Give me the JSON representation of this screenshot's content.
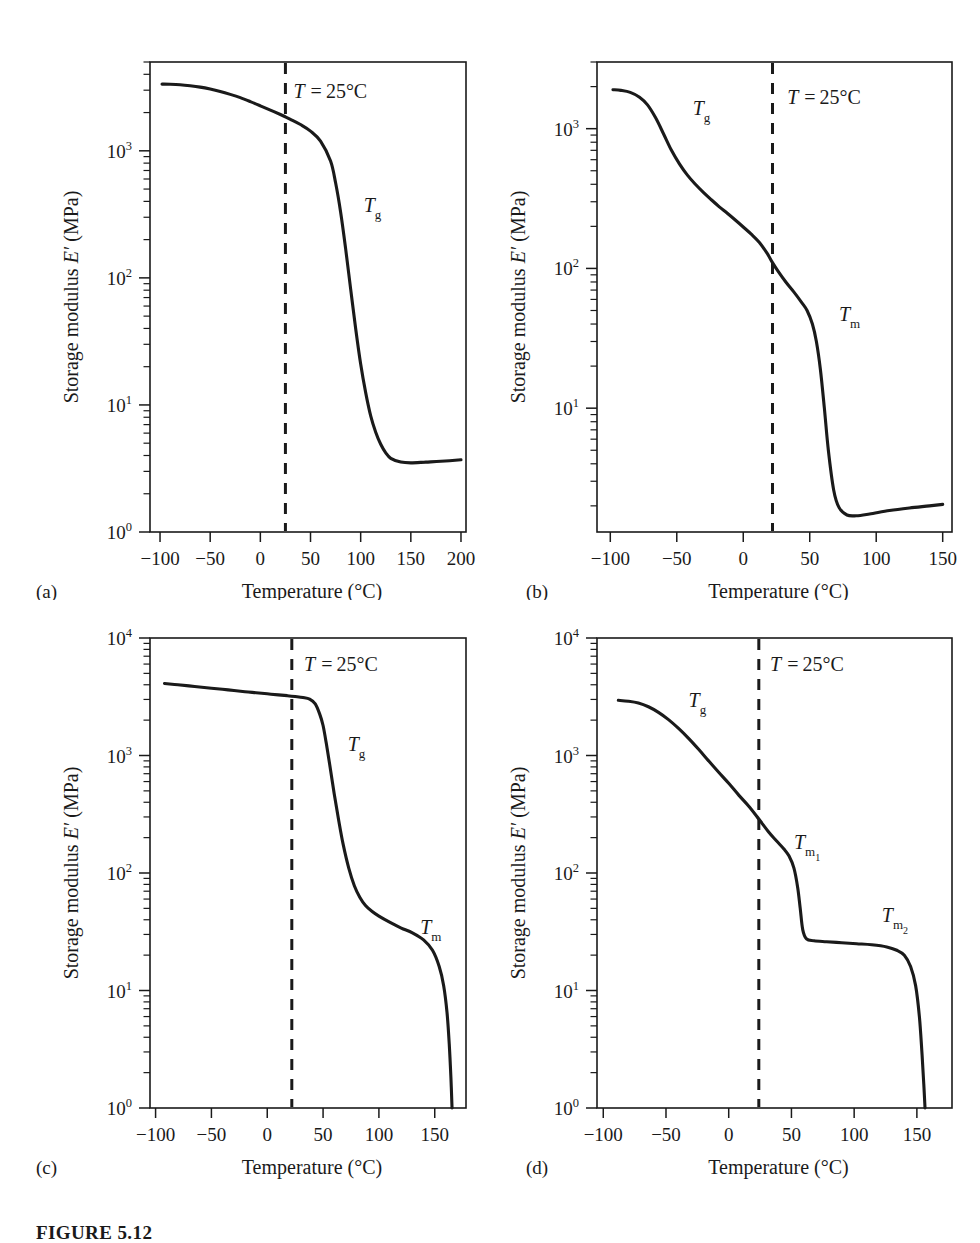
{
  "figure": {
    "caption_label": "FIGURE 5.12",
    "axis_x_title": "Temperature (°C)",
    "axis_y_title_prefix": "Storage modulus ",
    "axis_y_title_symbol": "E′",
    "axis_y_title_units": " (MPa)",
    "marker_label": "T = 25°C",
    "marker_temperature": 25
  },
  "chart_data": [
    {
      "type": "line",
      "panel": "a",
      "panel_letter": "(a)",
      "title": "",
      "xlabel": "Temperature (°C)",
      "ylabel": "Storage modulus E′ (MPa)",
      "xlim": [
        -110,
        205
      ],
      "ylim": [
        1,
        5000
      ],
      "yscale": "log",
      "xticks": [
        -100,
        -50,
        0,
        50,
        100,
        150,
        200
      ],
      "xtick_labels": [
        "−100",
        "−50",
        "0",
        "50",
        "100",
        "150",
        "200"
      ],
      "yticks": [
        1,
        10,
        100,
        1000
      ],
      "ytick_labels": [
        "10⁰",
        "10¹",
        "10²",
        "10³"
      ],
      "grid": false,
      "annotations": [
        {
          "text": "T = 25°C",
          "x": 33,
          "y": 2600,
          "kind": "marker-label"
        },
        {
          "text": "Tg",
          "base": "T",
          "sub": "g",
          "x": 103,
          "y": 330,
          "kind": "transition"
        }
      ],
      "vline": {
        "x": 25,
        "style": "dashed",
        "label": "T = 25°C"
      },
      "series": [
        {
          "name": "storage modulus",
          "x": [
            -98,
            -90,
            -80,
            -70,
            -60,
            -50,
            -40,
            -30,
            -20,
            -10,
            0,
            10,
            20,
            25,
            30,
            40,
            50,
            60,
            70,
            75,
            80,
            85,
            90,
            95,
            100,
            105,
            110,
            115,
            120,
            125,
            130,
            140,
            150,
            165,
            180,
            200
          ],
          "y": [
            3350,
            3340,
            3310,
            3250,
            3170,
            3060,
            2930,
            2780,
            2620,
            2440,
            2260,
            2090,
            1930,
            1850,
            1770,
            1610,
            1430,
            1190,
            830,
            560,
            330,
            170,
            82,
            40,
            21,
            12.5,
            8.2,
            6.1,
            4.9,
            4.2,
            3.8,
            3.55,
            3.5,
            3.55,
            3.6,
            3.7
          ]
        }
      ]
    },
    {
      "type": "line",
      "panel": "b",
      "panel_letter": "(b)",
      "title": "",
      "xlabel": "Temperature (°C)",
      "ylabel": "Storage modulus E′ (MPa)",
      "xlim": [
        -110,
        157
      ],
      "ylim": [
        1.3,
        3000
      ],
      "yscale": "log",
      "xticks": [
        -100,
        -50,
        0,
        50,
        100,
        150
      ],
      "xtick_labels": [
        "−100",
        "−50",
        "0",
        "50",
        "100",
        "150"
      ],
      "yticks": [
        10,
        100,
        1000
      ],
      "ytick_labels": [
        "10¹",
        "10²",
        "10³"
      ],
      "grid": false,
      "annotations": [
        {
          "text": "T = 25°C",
          "x": 33,
          "y": 1500,
          "kind": "marker-label"
        },
        {
          "text": "Tg",
          "base": "T",
          "sub": "g",
          "x": -38,
          "y": 1250,
          "kind": "transition"
        },
        {
          "text": "Tm",
          "base": "T",
          "sub": "m",
          "x": 72,
          "y": 42,
          "kind": "transition"
        }
      ],
      "vline": {
        "x": 22,
        "style": "dashed",
        "label": "T = 25°C"
      },
      "series": [
        {
          "name": "storage modulus",
          "x": [
            -98,
            -92,
            -85,
            -78,
            -72,
            -66,
            -60,
            -54,
            -48,
            -42,
            -36,
            -30,
            -24,
            -18,
            -12,
            -6,
            0,
            6,
            12,
            18,
            22,
            26,
            32,
            38,
            44,
            48,
            52,
            55,
            58,
            61,
            64,
            68,
            72,
            78,
            85,
            95,
            110,
            125,
            140,
            150
          ],
          "y": [
            1900,
            1880,
            1820,
            1680,
            1480,
            1200,
            920,
            700,
            560,
            465,
            400,
            350,
            310,
            276,
            248,
            222,
            198,
            176,
            154,
            128,
            110,
            96,
            80,
            68,
            57,
            50,
            40,
            30,
            19,
            10,
            5.0,
            2.6,
            1.95,
            1.72,
            1.7,
            1.75,
            1.85,
            1.93,
            2.0,
            2.05
          ]
        }
      ]
    },
    {
      "type": "line",
      "panel": "c",
      "panel_letter": "(c)",
      "title": "",
      "xlabel": "Temperature (°C)",
      "ylabel": "Storage modulus E′ (MPa)",
      "xlim": [
        -105,
        178
      ],
      "ylim": [
        1,
        10000
      ],
      "yscale": "log",
      "xticks": [
        -100,
        -50,
        0,
        50,
        100,
        150
      ],
      "xtick_labels": [
        "−100",
        "−50",
        "0",
        "50",
        "100",
        "150"
      ],
      "yticks": [
        1,
        10,
        100,
        1000,
        10000
      ],
      "ytick_labels": [
        "10⁰",
        "10¹",
        "10²",
        "10³",
        "10⁴"
      ],
      "grid": false,
      "annotations": [
        {
          "text": "T = 25°C",
          "x": 33,
          "y": 5200,
          "kind": "marker-label"
        },
        {
          "text": "Tg",
          "base": "T",
          "sub": "g",
          "x": 72,
          "y": 1100,
          "kind": "transition"
        },
        {
          "text": "Tm",
          "base": "T",
          "sub": "m",
          "x": 137,
          "y": 30,
          "kind": "transition"
        }
      ],
      "vline": {
        "x": 22,
        "style": "dashed",
        "label": "T = 25°C"
      },
      "series": [
        {
          "name": "storage modulus",
          "x": [
            -92,
            -80,
            -65,
            -50,
            -35,
            -20,
            -10,
            0,
            10,
            18,
            25,
            32,
            38,
            43,
            47,
            50,
            53,
            56,
            60,
            64,
            68,
            73,
            78,
            83,
            88,
            94,
            100,
            110,
            120,
            130,
            140,
            148,
            154,
            158,
            161,
            163,
            164.5,
            165.5
          ],
          "y": [
            4100,
            4000,
            3870,
            3740,
            3620,
            3490,
            3420,
            3350,
            3280,
            3230,
            3180,
            3120,
            3020,
            2750,
            2250,
            1800,
            1250,
            830,
            470,
            280,
            175,
            110,
            78,
            62,
            53,
            47,
            43,
            38,
            34,
            31,
            27,
            22,
            16,
            11,
            6.5,
            3.5,
            1.8,
            1.0
          ]
        }
      ]
    },
    {
      "type": "line",
      "panel": "d",
      "panel_letter": "(d)",
      "title": "",
      "xlabel": "Temperature (°C)",
      "ylabel": "Storage modulus E′ (MPa)",
      "xlim": [
        -105,
        178
      ],
      "ylim": [
        1,
        10000
      ],
      "yscale": "log",
      "xticks": [
        -100,
        -50,
        0,
        50,
        100,
        150
      ],
      "xtick_labels": [
        "−100",
        "−50",
        "0",
        "50",
        "100",
        "150"
      ],
      "yticks": [
        1,
        10,
        100,
        1000,
        10000
      ],
      "ytick_labels": [
        "10⁰",
        "10¹",
        "10²",
        "10³",
        "10⁴"
      ],
      "grid": false,
      "annotations": [
        {
          "text": "T = 25°C",
          "x": 33,
          "y": 5200,
          "kind": "marker-label"
        },
        {
          "text": "Tg",
          "base": "T",
          "sub": "g",
          "x": -32,
          "y": 2600,
          "kind": "transition"
        },
        {
          "text": "Tm1",
          "base": "T",
          "sub": "m",
          "sub2": "1",
          "x": 52,
          "y": 160,
          "kind": "transition"
        },
        {
          "text": "Tm2",
          "base": "T",
          "sub": "m",
          "sub2": "2",
          "x": 122,
          "y": 38,
          "kind": "transition"
        }
      ],
      "vline": {
        "x": 24,
        "style": "dashed",
        "label": "T = 25°C"
      },
      "series": [
        {
          "name": "storage modulus",
          "x": [
            -88,
            -80,
            -72,
            -64,
            -56,
            -48,
            -40,
            -32,
            -24,
            -16,
            -8,
            0,
            8,
            16,
            24,
            32,
            38,
            44,
            48,
            52,
            55,
            57,
            59,
            62,
            68,
            78,
            90,
            102,
            114,
            126,
            134,
            140,
            145,
            149,
            152,
            154,
            155.5,
            156.5
          ],
          "y": [
            2950,
            2900,
            2800,
            2600,
            2330,
            2020,
            1700,
            1400,
            1130,
            900,
            720,
            580,
            460,
            370,
            288,
            222,
            188,
            160,
            140,
            110,
            75,
            50,
            33,
            27.5,
            26.5,
            26,
            25.5,
            25,
            24.5,
            23.5,
            22,
            20,
            16,
            11,
            6.0,
            3.0,
            1.6,
            1.0
          ]
        }
      ]
    }
  ]
}
